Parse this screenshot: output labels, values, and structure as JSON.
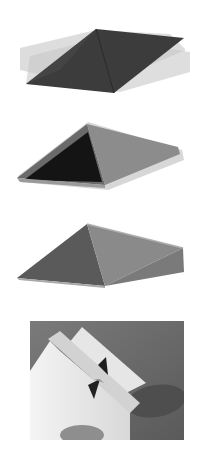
{
  "figure": {
    "panels": [
      {
        "id": "panel-1",
        "description": "Flat diamond pyramid with translucent ghosted offsets",
        "fill_main": "#3c3c3c",
        "fill_ghost": "#bdbdbd"
      },
      {
        "id": "panel-2",
        "description": "Pyramid with blurred motion ghosting, dark left face",
        "fill_left": "#141414",
        "fill_right": "#8c8c8c",
        "fill_ghost": "#b8b8b8"
      },
      {
        "id": "panel-3",
        "description": "Solid pyramid, grey faces",
        "fill_left": "#5a5a5a",
        "fill_right": "#8a8a8a",
        "fill_edge": "#a8a8a8"
      },
      {
        "id": "panel-4",
        "description": "Photograph of a folded paper model with a small pyramid cut-out held by a hand",
        "background": "#6e6e6e"
      }
    ]
  }
}
